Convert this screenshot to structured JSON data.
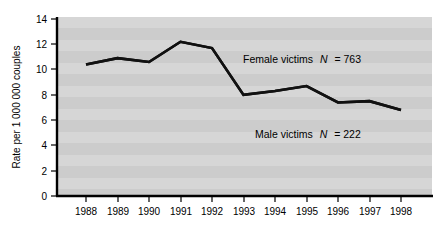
{
  "chart_data": {
    "type": "line",
    "title": "",
    "xlabel": "",
    "ylabel": "Rate per 1 000 000 couples",
    "categories": [
      "1988",
      "1989",
      "1990",
      "1991",
      "1992",
      "1993",
      "1994",
      "1995",
      "1996",
      "1997",
      "1998"
    ],
    "ylim": [
      0,
      14
    ],
    "yticks": [
      0,
      2,
      4,
      6,
      8,
      10,
      12,
      14
    ],
    "ytick_labels": [
      "0",
      "2",
      "4",
      "6",
      "8",
      "10",
      "12",
      "14"
    ],
    "grid": "horizontal-banded-gray",
    "legend": "inline-annotations",
    "series": [
      {
        "name": "Female victims",
        "annotation": "Female victims",
        "annotation_italic": "N",
        "annotation_tail": "= 763",
        "n": 763,
        "values": [
          10.4,
          10.9,
          10.6,
          12.2,
          11.7,
          8.0,
          8.3,
          8.7,
          7.4,
          7.5,
          6.8
        ]
      },
      {
        "name": "Male victims",
        "annotation": "Male victims",
        "annotation_italic": "N",
        "annotation_tail": "= 222",
        "n": 222,
        "values": [
          3.1,
          3.0,
          3.7,
          3.6,
          2.6,
          3.5,
          2.8,
          2.8,
          2.6,
          1.8,
          1.8
        ]
      }
    ],
    "colors": {
      "line": "#111111",
      "plot_background": "#c9c9c9",
      "band": "#d8d8d8",
      "axis": "#000000",
      "page_background": "#ffffff"
    }
  },
  "annotations": {
    "female": {
      "label": "Female victims",
      "italic": "N",
      "tail": "= 763"
    },
    "male": {
      "label": "Male victims",
      "italic": "N",
      "tail": "= 222"
    }
  },
  "axis": {
    "y_title": "Rate per 1 000 000 couples",
    "y_ticks": [
      "14",
      "12",
      "10",
      "8",
      "6",
      "4",
      "2",
      "0"
    ],
    "x_ticks": [
      "1988",
      "1989",
      "1990",
      "1991",
      "1992",
      "1993",
      "1994",
      "1995",
      "1996",
      "1997",
      "1998"
    ]
  }
}
